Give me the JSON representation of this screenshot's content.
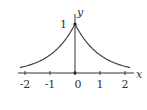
{
  "chart_data": {
    "type": "line",
    "title": "",
    "xlabel": "x",
    "ylabel": "y",
    "x_ticks": [
      "-2",
      "-1",
      "0",
      "1",
      "2"
    ],
    "y_ticks": [
      "1"
    ],
    "xlim": [
      -2.2,
      2.2
    ],
    "ylim": [
      0,
      1
    ],
    "grid": false,
    "legend": null,
    "series": [
      {
        "name": "y = e^(-|x|)",
        "x": [
          -2.2,
          -2,
          -1.5,
          -1,
          -0.5,
          0,
          0.5,
          1,
          1.5,
          2,
          2.2
        ],
        "y": [
          0.11,
          0.135,
          0.223,
          0.368,
          0.607,
          1.0,
          0.607,
          0.368,
          0.223,
          0.135,
          0.11
        ]
      }
    ],
    "annotations": [
      {
        "text": "1",
        "at": [
          0,
          1
        ]
      }
    ]
  },
  "labels": {
    "x_axis": "x",
    "y_axis": "y",
    "y_one": "1",
    "ticks": [
      "-2",
      "-1",
      "0",
      "1",
      "2"
    ]
  }
}
